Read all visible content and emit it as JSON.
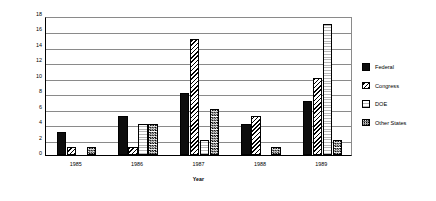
{
  "chart_data": {
    "type": "bar",
    "title": "",
    "xlabel": "Year",
    "ylabel": "Number of times cited",
    "categories": [
      "1985",
      "1986",
      "1987",
      "1988",
      "1989"
    ],
    "series": [
      {
        "name": "Federal",
        "values": [
          3,
          5,
          8,
          4,
          7
        ],
        "pattern": "solid-black"
      },
      {
        "name": "Congress",
        "values": [
          1,
          1,
          15,
          5,
          10
        ],
        "pattern": "diagonal-hatch"
      },
      {
        "name": "DOE",
        "values": [
          0,
          4,
          2,
          0,
          17
        ],
        "pattern": "fine-dotted-grid"
      },
      {
        "name": "Other States",
        "values": [
          1,
          4,
          6,
          1,
          2
        ],
        "pattern": "checkerboard"
      }
    ],
    "ylim": [
      0,
      18
    ],
    "yticks": [
      0,
      2,
      4,
      6,
      8,
      10,
      12,
      14,
      16,
      18
    ],
    "grid": true,
    "legend_position": "right"
  },
  "legend": {
    "items": [
      {
        "label": "Federal"
      },
      {
        "label": "Congress"
      },
      {
        "label": "DOE"
      },
      {
        "label": "Other States"
      }
    ]
  }
}
